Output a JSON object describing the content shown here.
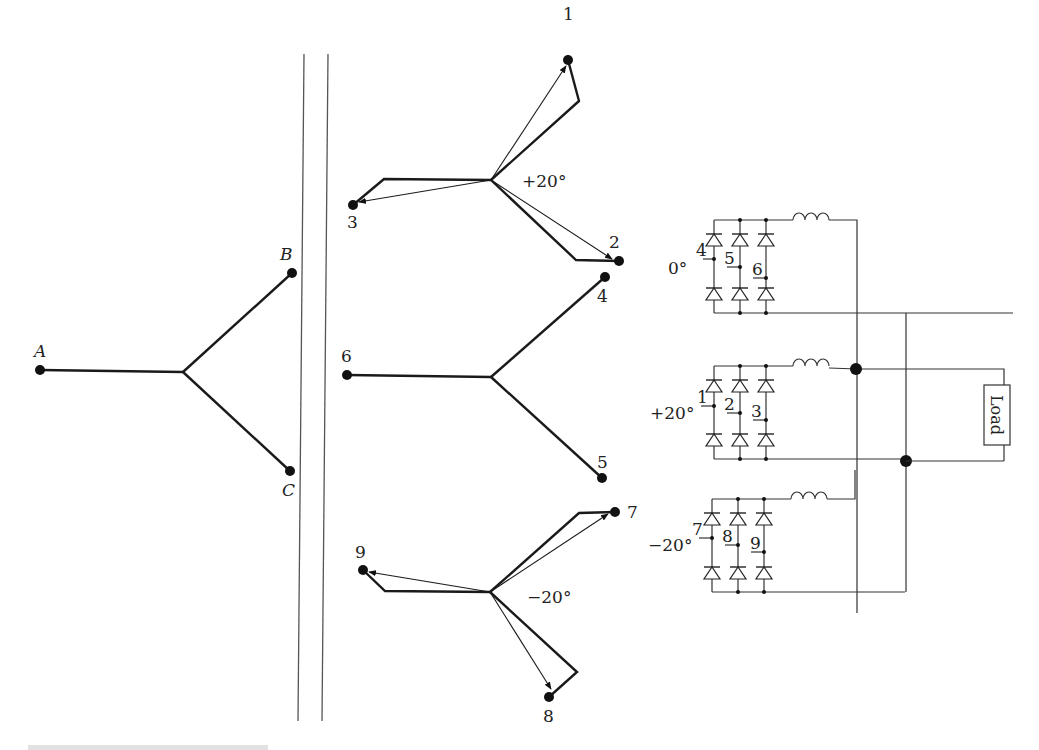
{
  "figure": {
    "primary": {
      "labels": [
        "A",
        "B",
        "C"
      ],
      "center": [
        183,
        372
      ],
      "terminals": {
        "A": [
          40,
          370
        ],
        "B": [
          292,
          272
        ],
        "C": [
          290,
          471
        ]
      }
    },
    "core": {
      "line1": [
        [
          304,
          54
        ],
        [
          298,
          721
        ]
      ],
      "line2": [
        [
          328,
          54
        ],
        [
          322,
          721
        ]
      ]
    },
    "secondaries": [
      {
        "shift_label": "+20°",
        "center": [
          491,
          180
        ],
        "terminals": [
          {
            "label": "1",
            "point": [
              568,
              60
            ],
            "knee": [
              579,
              101
            ]
          },
          {
            "label": "2",
            "point": [
              619,
              261
            ],
            "knee": [
              576,
              260
            ]
          },
          {
            "label": "3",
            "point": [
              353,
              205
            ],
            "knee": [
              384,
              179
            ]
          }
        ]
      },
      {
        "shift_label": "0°",
        "center": [
          491,
          377
        ],
        "terminals": [
          {
            "label": "4",
            "point": [
              605,
              277
            ]
          },
          {
            "label": "5",
            "point": [
              602,
              478
            ]
          },
          {
            "label": "6",
            "point": [
              347,
              375
            ]
          }
        ]
      },
      {
        "shift_label": "−20°",
        "center": [
          490,
          592
        ],
        "terminals": [
          {
            "label": "7",
            "point": [
              615,
              512
            ],
            "knee": [
              579,
              513
            ]
          },
          {
            "label": "8",
            "point": [
              549,
              697
            ],
            "knee": [
              577,
              672
            ]
          },
          {
            "label": "9",
            "point": [
              363,
              570
            ],
            "knee": [
              385,
              591
            ]
          }
        ]
      }
    ],
    "bridges": [
      {
        "angle_label": "0°",
        "phase_labels": [
          "4",
          "5",
          "6"
        ],
        "top_y": 220,
        "bottom_y": 313
      },
      {
        "angle_label": "+20°",
        "phase_labels": [
          "1",
          "2",
          "3"
        ],
        "top_y": 366,
        "bottom_y": 459
      },
      {
        "angle_label": "−20°",
        "phase_labels": [
          "7",
          "8",
          "9"
        ],
        "top_y": 499,
        "bottom_y": 592
      }
    ],
    "load_label": "Load"
  }
}
